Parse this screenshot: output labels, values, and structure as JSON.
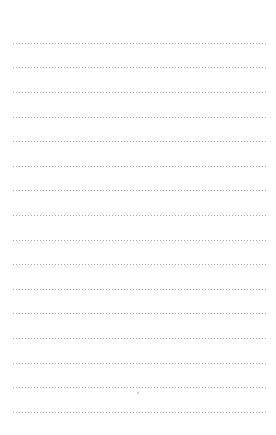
{
  "page": {
    "type": "dotted-lined-paper",
    "background_color": "#ffffff",
    "dot_color": "#a9a9a9",
    "line_count": 16,
    "first_line_y": 43,
    "line_spacing": 24.6,
    "line_left": 12,
    "line_right": 265
  },
  "lines": [
    {
      "y": 43
    },
    {
      "y": 67
    },
    {
      "y": 92
    },
    {
      "y": 117
    },
    {
      "y": 141
    },
    {
      "y": 166
    },
    {
      "y": 190
    },
    {
      "y": 215
    },
    {
      "y": 240
    },
    {
      "y": 264
    },
    {
      "y": 289
    },
    {
      "y": 313
    },
    {
      "y": 338
    },
    {
      "y": 363
    },
    {
      "y": 387
    },
    {
      "y": 412
    }
  ]
}
